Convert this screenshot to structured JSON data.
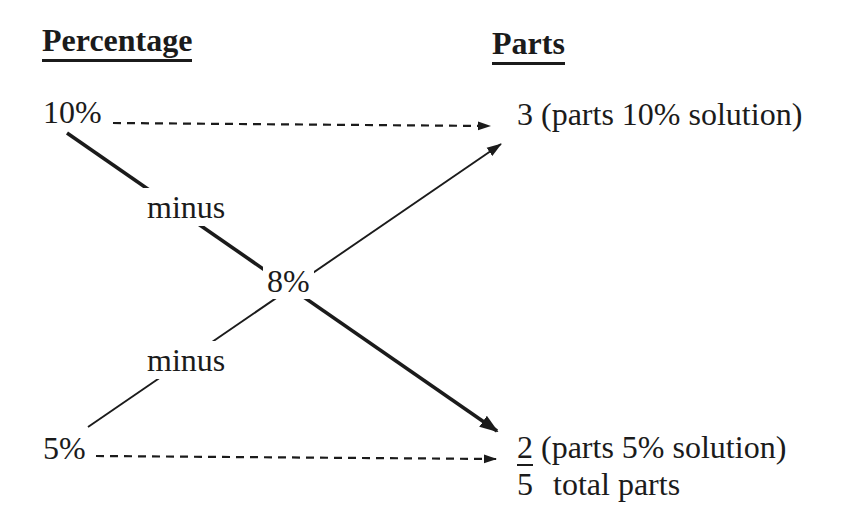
{
  "colors": {
    "ink": "#1b1b1b",
    "background": "#ffffff"
  },
  "headers": {
    "left": "Percentage",
    "right": "Parts"
  },
  "nodes": {
    "top_left": "10%",
    "bottom_left": "5%",
    "center": "8%"
  },
  "operations": {
    "upper": "minus",
    "lower": "minus"
  },
  "results": {
    "top": "3 (parts 10% solution)",
    "bottom_numerator": "2",
    "bottom_rest": "(parts 5% solution)",
    "total_value": "5",
    "total_label": "total parts"
  },
  "icons": {
    "arrows": [
      "dashed-arrow-icon",
      "solid-arrow-icon"
    ]
  }
}
